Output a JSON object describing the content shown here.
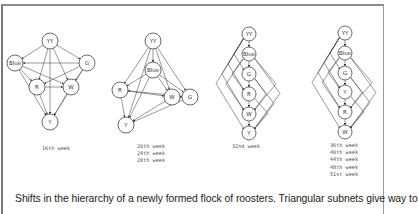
{
  "figure": {
    "caption": "Shifts in the hierarchy of a newly formed flock of roosters. Triangular subnets give way to",
    "panels": [
      {
        "id": "panel-16th",
        "weeks": [
          "16th week"
        ],
        "label_pos": [
          42,
          150
        ],
        "nodes": [
          {
            "id": "YY",
            "x": 50,
            "y": 41,
            "r": 8
          },
          {
            "id": "Blue",
            "x": 15,
            "y": 63,
            "r": 8
          },
          {
            "id": "G",
            "x": 87,
            "y": 63,
            "r": 8
          },
          {
            "id": "R",
            "x": 37,
            "y": 87,
            "r": 8
          },
          {
            "id": "W",
            "x": 71,
            "y": 87,
            "r": 8
          },
          {
            "id": "Y",
            "x": 50,
            "y": 122,
            "r": 8
          }
        ],
        "edges": [
          [
            "YY",
            "Blue"
          ],
          [
            "YY",
            "G"
          ],
          [
            "YY",
            "R"
          ],
          [
            "YY",
            "W"
          ],
          [
            "YY",
            "Y"
          ],
          [
            "G",
            "Blue"
          ],
          [
            "Blue",
            "R"
          ],
          [
            "Blue",
            "W"
          ],
          [
            "Blue",
            "Y"
          ],
          [
            "G",
            "R"
          ],
          [
            "G",
            "W"
          ],
          [
            "G",
            "Y"
          ],
          [
            "R",
            "W"
          ],
          [
            "R",
            "Y"
          ],
          [
            "W",
            "Y"
          ]
        ]
      },
      {
        "id": "panel-20th-28th",
        "weeks": [
          "20th  week",
          "24th  week",
          "28th  week"
        ],
        "label_pos": [
          137,
          148
        ],
        "nodes": [
          {
            "id": "YY",
            "x": 153,
            "y": 41,
            "r": 8
          },
          {
            "id": "Blue",
            "x": 153,
            "y": 70,
            "r": 8
          },
          {
            "id": "R",
            "x": 120,
            "y": 90,
            "r": 8
          },
          {
            "id": "W",
            "x": 172,
            "y": 97,
            "r": 8
          },
          {
            "id": "G",
            "x": 190,
            "y": 97,
            "r": 8
          },
          {
            "id": "Y",
            "x": 126,
            "y": 125,
            "r": 8
          }
        ],
        "edges": [
          [
            "YY",
            "Blue"
          ],
          [
            "YY",
            "R"
          ],
          [
            "YY",
            "W"
          ],
          [
            "YY",
            "G"
          ],
          [
            "YY",
            "Y"
          ],
          [
            "Blue",
            "R"
          ],
          [
            "Blue",
            "W"
          ],
          [
            "Blue",
            "G"
          ],
          [
            "Blue",
            "Y"
          ],
          [
            "R",
            "W"
          ],
          [
            "R",
            "Y"
          ],
          [
            "W",
            "Y"
          ],
          [
            "G",
            "Y"
          ],
          [
            "G",
            "R"
          ],
          [
            "W",
            "G"
          ]
        ]
      },
      {
        "id": "panel-32nd",
        "weeks": [
          "32nd  week"
        ],
        "label_pos": [
          232,
          148
        ],
        "nodes": [
          {
            "id": "YY",
            "x": 249,
            "y": 34,
            "r": 7
          },
          {
            "id": "Blue",
            "x": 249,
            "y": 54,
            "r": 7
          },
          {
            "id": "G",
            "x": 249,
            "y": 74,
            "r": 7
          },
          {
            "id": "R",
            "x": 249,
            "y": 94,
            "r": 7
          },
          {
            "id": "W",
            "x": 249,
            "y": 114,
            "r": 7
          },
          {
            "id": "Y",
            "x": 249,
            "y": 133,
            "r": 7
          }
        ],
        "edges": [
          [
            "YY",
            "Blue"
          ],
          [
            "Blue",
            "G"
          ],
          [
            "G",
            "R"
          ],
          [
            "R",
            "W"
          ],
          [
            "W",
            "Y"
          ]
        ],
        "arcs_left": [
          [
            0,
            2,
            8
          ],
          [
            0,
            3,
            14
          ],
          [
            0,
            4,
            20
          ],
          [
            0,
            5,
            26
          ],
          [
            1,
            3,
            10
          ],
          [
            1,
            4,
            16
          ]
        ],
        "arcs_right": [
          [
            1,
            5,
            24
          ],
          [
            2,
            4,
            10
          ],
          [
            2,
            5,
            18
          ],
          [
            3,
            5,
            12
          ],
          [
            1,
            4,
            20
          ]
        ]
      },
      {
        "id": "panel-36th-51st",
        "weeks": [
          "36th  week",
          "40th  week",
          "44th  week",
          "48th  week",
          "51st  week"
        ],
        "label_pos": [
          330,
          147
        ],
        "nodes": [
          {
            "id": "YY",
            "x": 345,
            "y": 33,
            "r": 7
          },
          {
            "id": "Blue",
            "x": 345,
            "y": 53,
            "r": 7
          },
          {
            "id": "G",
            "x": 345,
            "y": 73,
            "r": 7
          },
          {
            "id": "Y",
            "x": 345,
            "y": 92,
            "r": 7
          },
          {
            "id": "R",
            "x": 345,
            "y": 112,
            "r": 7
          },
          {
            "id": "W",
            "x": 345,
            "y": 132,
            "r": 7
          }
        ],
        "edges": [
          [
            "YY",
            "Blue"
          ],
          [
            "Blue",
            "G"
          ],
          [
            "G",
            "Y"
          ],
          [
            "Y",
            "R"
          ],
          [
            "R",
            "W"
          ]
        ],
        "arcs_left": [
          [
            0,
            2,
            8
          ],
          [
            0,
            3,
            14
          ],
          [
            0,
            4,
            20
          ],
          [
            0,
            5,
            26
          ],
          [
            1,
            3,
            10
          ],
          [
            1,
            4,
            16
          ]
        ],
        "arcs_right": [
          [
            1,
            5,
            24
          ],
          [
            2,
            4,
            10
          ],
          [
            2,
            5,
            18
          ],
          [
            3,
            5,
            12
          ],
          [
            1,
            4,
            20
          ]
        ]
      }
    ]
  }
}
